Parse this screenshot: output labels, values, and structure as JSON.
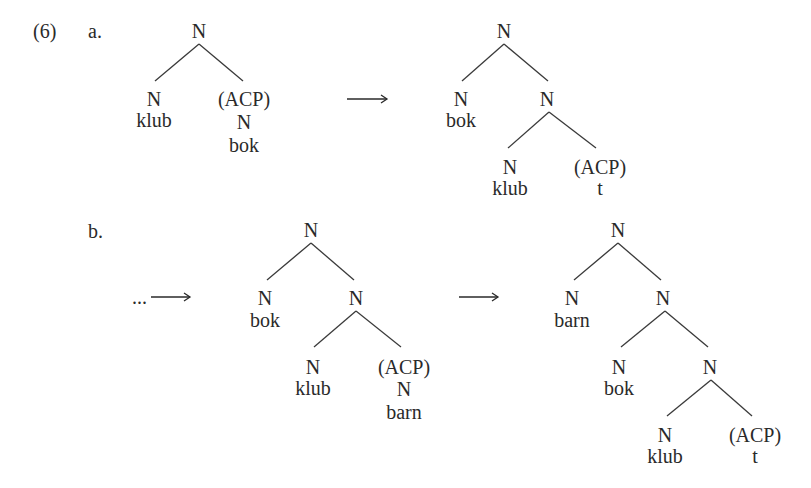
{
  "example": {
    "number": "(6)",
    "parts": [
      {
        "label": "a."
      },
      {
        "label": "b."
      }
    ]
  },
  "arrows": {
    "a_arrow": "⟶",
    "b_ellipsis": "...",
    "b_arrow2": "⟶"
  },
  "trees": {
    "a1": {
      "root": "N",
      "left": {
        "cat": "N",
        "word": "klub"
      },
      "right": {
        "cat": "(ACP)",
        "sub": "N",
        "word": "bok"
      }
    },
    "a2": {
      "root": "N",
      "left": {
        "cat": "N",
        "word": "bok"
      },
      "right": {
        "cat": "N",
        "left": {
          "cat": "N",
          "word": "klub"
        },
        "right": {
          "cat": "(ACP)",
          "word": "t"
        }
      }
    },
    "b1": {
      "root": "N",
      "left": {
        "cat": "N",
        "word": "bok"
      },
      "right": {
        "cat": "N",
        "left": {
          "cat": "N",
          "word": "klub"
        },
        "right": {
          "cat": "(ACP)",
          "sub": "N",
          "word": "barn"
        }
      }
    },
    "b2": {
      "root": "N",
      "left": {
        "cat": "N",
        "word": "barn"
      },
      "right": {
        "cat": "N",
        "left": {
          "cat": "N",
          "word": "bok"
        },
        "right": {
          "cat": "N",
          "left": {
            "cat": "N",
            "word": "klub"
          },
          "right": {
            "cat": "(ACP)",
            "word": "t"
          }
        }
      }
    }
  }
}
